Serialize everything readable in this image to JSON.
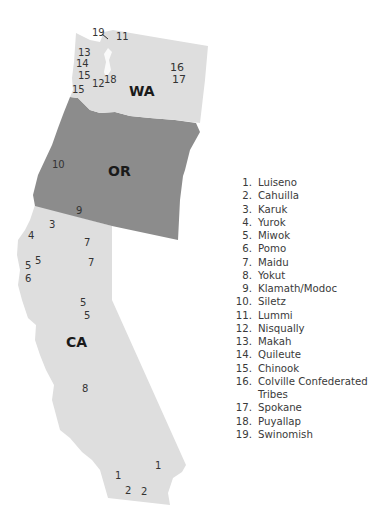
{
  "colors": {
    "background": "#ffffff",
    "washington_fill": "#dedede",
    "oregon_fill": "#8c8c8c",
    "california_fill": "#dedede",
    "label_text": "#333333"
  },
  "states": {
    "wa": {
      "label": "WA",
      "x": 129,
      "y": 96
    },
    "or": {
      "label": "OR",
      "x": 108,
      "y": 176
    },
    "ca": {
      "label": "CA",
      "x": 66,
      "y": 347
    }
  },
  "markers": [
    {
      "label": "19",
      "x": 92,
      "y": 36
    },
    {
      "label": "11",
      "x": 116,
      "y": 40
    },
    {
      "label": "13",
      "x": 78,
      "y": 56
    },
    {
      "label": "14",
      "x": 76,
      "y": 67
    },
    {
      "label": "15",
      "x": 78,
      "y": 79
    },
    {
      "label": "12",
      "x": 92,
      "y": 87
    },
    {
      "label": "18",
      "x": 104,
      "y": 83
    },
    {
      "label": "15",
      "x": 72,
      "y": 93
    },
    {
      "label": "16",
      "x": 170,
      "y": 71
    },
    {
      "label": "17",
      "x": 172,
      "y": 83
    },
    {
      "label": "10",
      "x": 52,
      "y": 168
    },
    {
      "label": "9",
      "x": 76,
      "y": 214
    },
    {
      "label": "3",
      "x": 49,
      "y": 228
    },
    {
      "label": "4",
      "x": 28,
      "y": 239
    },
    {
      "label": "7",
      "x": 84,
      "y": 246
    },
    {
      "label": "5",
      "x": 35,
      "y": 264
    },
    {
      "label": "5",
      "x": 25,
      "y": 269
    },
    {
      "label": "7",
      "x": 88,
      "y": 266
    },
    {
      "label": "6",
      "x": 25,
      "y": 282
    },
    {
      "label": "5",
      "x": 80,
      "y": 306
    },
    {
      "label": "5",
      "x": 84,
      "y": 319
    },
    {
      "label": "8",
      "x": 82,
      "y": 392
    },
    {
      "label": "1",
      "x": 155,
      "y": 469
    },
    {
      "label": "1",
      "x": 115,
      "y": 479
    },
    {
      "label": "2",
      "x": 125,
      "y": 494
    },
    {
      "label": "2",
      "x": 141,
      "y": 495
    }
  ],
  "legend": {
    "items": [
      {
        "num": "1.",
        "name": "Luiseno"
      },
      {
        "num": "2.",
        "name": "Cahuilla"
      },
      {
        "num": "3.",
        "name": "Karuk"
      },
      {
        "num": "4.",
        "name": "Yurok"
      },
      {
        "num": "5.",
        "name": "Miwok"
      },
      {
        "num": "6.",
        "name": "Pomo"
      },
      {
        "num": "7.",
        "name": "Maidu"
      },
      {
        "num": "8.",
        "name": "Yokut"
      },
      {
        "num": "9.",
        "name": "Klamath/Modoc"
      },
      {
        "num": "10.",
        "name": "Siletz"
      },
      {
        "num": "11.",
        "name": "Lummi"
      },
      {
        "num": "12.",
        "name": "Nisqually"
      },
      {
        "num": "13.",
        "name": "Makah"
      },
      {
        "num": "14.",
        "name": "Quileute"
      },
      {
        "num": "15.",
        "name": "Chinook"
      },
      {
        "num": "16.",
        "name": "Colville Confederated Tribes"
      },
      {
        "num": "17.",
        "name": "Spokane"
      },
      {
        "num": "18.",
        "name": "Puyallap"
      },
      {
        "num": "19.",
        "name": "Swinomish"
      }
    ]
  }
}
